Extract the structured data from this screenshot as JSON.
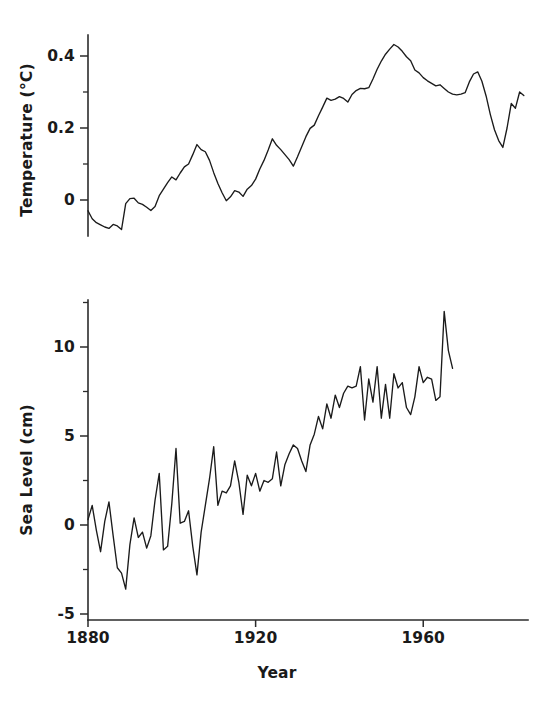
{
  "figure": {
    "background": "#ffffff",
    "ink_color": "#1a1a1a",
    "line_color": "#1b1b1b"
  },
  "chart_data": [
    {
      "id": "temperature",
      "type": "line",
      "title": "",
      "xlabel": "",
      "ylabel": "Temperature (°C)",
      "xlim": [
        1880,
        1985
      ],
      "ylim": [
        -0.1,
        0.48
      ],
      "grid": false,
      "legend": null,
      "xticks": [
        1880,
        1920,
        1960
      ],
      "xticklabels": [
        "1880",
        "1920",
        "1960"
      ],
      "yticks": [
        0,
        0.2,
        0.4
      ],
      "yticklabels": [
        "0",
        "0.2",
        "0.4"
      ],
      "yminorticks": [
        0.1,
        0.3
      ],
      "x_axis_visible": false,
      "x": [
        1880,
        1881,
        1882,
        1883,
        1884,
        1885,
        1886,
        1887,
        1888,
        1889,
        1890,
        1891,
        1892,
        1893,
        1894,
        1895,
        1896,
        1897,
        1898,
        1899,
        1900,
        1901,
        1902,
        1903,
        1904,
        1905,
        1906,
        1907,
        1908,
        1909,
        1910,
        1911,
        1912,
        1913,
        1914,
        1915,
        1916,
        1917,
        1918,
        1919,
        1920,
        1921,
        1922,
        1923,
        1924,
        1925,
        1926,
        1927,
        1928,
        1929,
        1930,
        1931,
        1932,
        1933,
        1934,
        1935,
        1936,
        1937,
        1938,
        1939,
        1940,
        1941,
        1942,
        1943,
        1944,
        1945,
        1946,
        1947,
        1948,
        1949,
        1950,
        1951,
        1952,
        1953,
        1954,
        1955,
        1956,
        1957,
        1958,
        1959,
        1960,
        1961,
        1962,
        1963,
        1964,
        1965,
        1966,
        1967,
        1968,
        1969,
        1970,
        1971,
        1972,
        1973,
        1974,
        1975,
        1976,
        1977,
        1978,
        1979,
        1980,
        1981,
        1982,
        1983,
        1984
      ],
      "y": [
        -0.03,
        -0.052,
        -0.063,
        -0.069,
        -0.075,
        -0.079,
        -0.068,
        -0.072,
        -0.082,
        -0.01,
        0.004,
        0.005,
        -0.008,
        -0.012,
        -0.02,
        -0.029,
        -0.018,
        0.012,
        0.03,
        0.048,
        0.064,
        0.056,
        0.075,
        0.092,
        0.1,
        0.126,
        0.154,
        0.14,
        0.134,
        0.11,
        0.076,
        0.046,
        0.02,
        -0.002,
        0.009,
        0.026,
        0.022,
        0.01,
        0.03,
        0.04,
        0.058,
        0.086,
        0.11,
        0.139,
        0.17,
        0.152,
        0.14,
        0.126,
        0.112,
        0.094,
        0.12,
        0.148,
        0.176,
        0.199,
        0.208,
        0.234,
        0.258,
        0.283,
        0.277,
        0.28,
        0.287,
        0.282,
        0.272,
        0.293,
        0.304,
        0.31,
        0.309,
        0.312,
        0.336,
        0.363,
        0.386,
        0.405,
        0.419,
        0.432,
        0.425,
        0.413,
        0.398,
        0.387,
        0.361,
        0.353,
        0.34,
        0.331,
        0.324,
        0.317,
        0.32,
        0.31,
        0.3,
        0.294,
        0.292,
        0.294,
        0.298,
        0.328,
        0.35,
        0.356,
        0.33,
        0.289,
        0.238,
        0.195,
        0.165,
        0.146,
        0.2,
        0.268,
        0.255,
        0.3,
        0.29
      ]
    },
    {
      "id": "sea_level",
      "type": "line",
      "title": "",
      "xlabel": "Year",
      "ylabel": "Sea Level (cm)",
      "xlim": [
        1880,
        1985
      ],
      "ylim": [
        -5,
        13
      ],
      "grid": false,
      "legend": null,
      "xticks": [
        1880,
        1920,
        1960
      ],
      "xticklabels": [
        "1880",
        "1920",
        "1960"
      ],
      "yticks": [
        -5,
        0,
        5,
        10
      ],
      "yticklabels": [
        "-5",
        "0",
        "5",
        "10"
      ],
      "yminorticks": [
        -2.5,
        2.5,
        7.5,
        12.5
      ],
      "x_axis_visible": true,
      "x": [
        1880,
        1881,
        1882,
        1883,
        1884,
        1885,
        1886,
        1887,
        1888,
        1889,
        1890,
        1891,
        1892,
        1893,
        1894,
        1895,
        1896,
        1897,
        1898,
        1899,
        1900,
        1901,
        1902,
        1903,
        1904,
        1905,
        1906,
        1907,
        1908,
        1909,
        1910,
        1911,
        1912,
        1913,
        1914,
        1915,
        1916,
        1917,
        1918,
        1919,
        1920,
        1921,
        1922,
        1923,
        1924,
        1925,
        1926,
        1927,
        1928,
        1929,
        1930,
        1931,
        1932,
        1933,
        1934,
        1935,
        1936,
        1937,
        1938,
        1939,
        1940,
        1941,
        1942,
        1943,
        1944,
        1945,
        1946,
        1947,
        1948,
        1949,
        1950,
        1951,
        1952,
        1953,
        1954,
        1955,
        1956,
        1957,
        1958,
        1959,
        1960,
        1961,
        1962,
        1963,
        1964,
        1965,
        1966,
        1967,
        1968,
        1969,
        1970,
        1971,
        1972,
        1973,
        1974,
        1975,
        1976,
        1977,
        1978,
        1979,
        1980,
        1981,
        1982,
        1983,
        1984
      ],
      "y": [
        0.3,
        1.1,
        -0.3,
        -1.5,
        0.2,
        1.3,
        -0.6,
        -2.4,
        -2.7,
        -3.6,
        -1.1,
        0.4,
        -0.7,
        -0.4,
        -1.3,
        -0.6,
        1.4,
        2.9,
        -1.4,
        -1.2,
        1.2,
        4.3,
        0.1,
        0.2,
        0.8,
        -1.2,
        -2.8,
        -0.4,
        1.1,
        2.6,
        4.4,
        1.1,
        1.9,
        1.8,
        2.2,
        3.6,
        2.4,
        0.6,
        2.8,
        2.2,
        2.9,
        1.9,
        2.5,
        2.4,
        2.6,
        4.1,
        2.2,
        3.4,
        4.0,
        4.5,
        4.3,
        3.6,
        3.0,
        4.5,
        5.1,
        6.1,
        5.4,
        6.8,
        6.0,
        7.3,
        6.6,
        7.4,
        7.8,
        7.7,
        7.8,
        8.9,
        5.9,
        8.2,
        6.9,
        8.9,
        6.0,
        7.9,
        6.0,
        8.5,
        7.7,
        8.0,
        6.6,
        6.2,
        7.2,
        8.9,
        8.0,
        8.3,
        8.2,
        7.0,
        7.2,
        12.0,
        9.8,
        8.8
      ]
    }
  ],
  "labels": {
    "top_panel_ylabel": "Temperature (°C)",
    "bottom_panel_ylabel": "Sea Level (cm)",
    "bottom_panel_xlabel": "Year"
  }
}
